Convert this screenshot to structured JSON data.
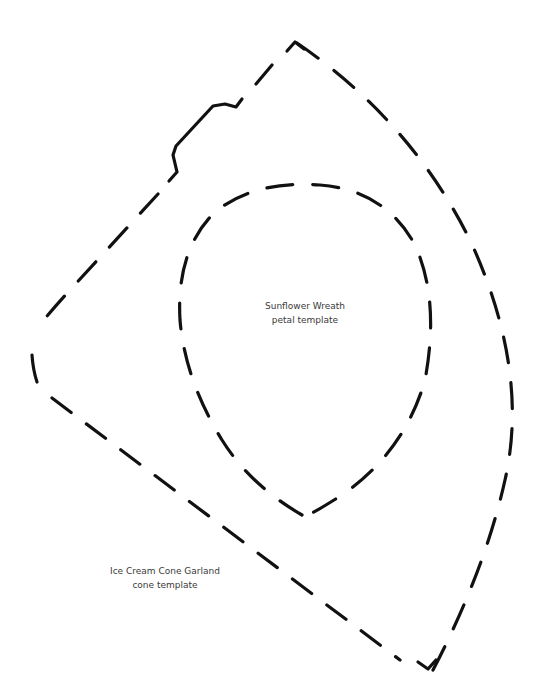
{
  "document": {
    "background": "#ffffff",
    "line_color": "#111111",
    "text_color": "#3a3a3a"
  },
  "templates": [
    {
      "id": "sunflower-petal",
      "title": "Sunflower Wreath",
      "subtitle": "petal template",
      "shape": "teardrop petal, dashed cut line"
    },
    {
      "id": "ice-cream-cone",
      "title": "Ice Cream Cone Garland",
      "subtitle": "cone template",
      "shape": "cone wedge, dashed cut line with solid segment at top-left"
    }
  ]
}
